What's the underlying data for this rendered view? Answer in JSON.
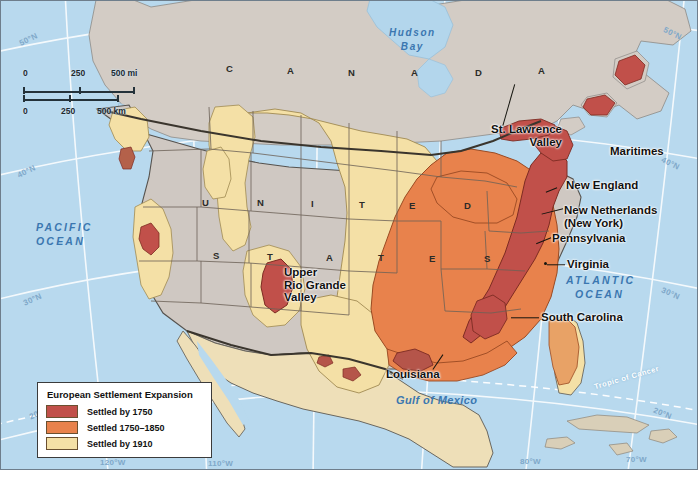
{
  "map": {
    "title": "European Settlement Expansion",
    "projection_note": "North America, conic projection",
    "background_water_color": "#b8d9ee",
    "land_unsettled_color": "#cfc8c2",
    "canada_land_color": "#d4cdc6"
  },
  "legend": {
    "title": "European Settlement Expansion",
    "items": [
      {
        "label": "Settled by 1750",
        "color": "#c1504a"
      },
      {
        "label": "Settled 1750–1850",
        "color": "#e8824c"
      },
      {
        "label": "Settled by 1910",
        "color": "#f4e0a6"
      }
    ]
  },
  "scale": {
    "miles": {
      "zero": "0",
      "mid": "250",
      "max": "500 mi"
    },
    "kilometers": {
      "zero": "0",
      "mid": "250",
      "max": "500 km"
    }
  },
  "country_labels": [
    {
      "text": "C A N A D A",
      "letters": [
        "C",
        "A",
        "N",
        "A",
        "D",
        "A"
      ]
    },
    {
      "text": "U N I T E D",
      "letters": [
        "U",
        "N",
        "I",
        "T",
        "E",
        "D"
      ]
    },
    {
      "text": "S T A T E S",
      "letters": [
        "S",
        "T",
        "A",
        "T",
        "E",
        "S"
      ]
    }
  ],
  "place_labels": [
    {
      "name": "st-lawrence-valley",
      "line1": "St. Lawrence",
      "line2": "Valley"
    },
    {
      "name": "maritimes",
      "line1": "Maritimes"
    },
    {
      "name": "new-england",
      "line1": "New England"
    },
    {
      "name": "new-netherlands",
      "line1": "New Netherlands",
      "line2": "(New York)"
    },
    {
      "name": "pennsylvania",
      "line1": "Pennsylvania"
    },
    {
      "name": "virginia",
      "line1": "Virginia"
    },
    {
      "name": "south-carolina",
      "line1": "South Carolina"
    },
    {
      "name": "louisiana",
      "line1": "Louisiana"
    },
    {
      "name": "upper-rio-grande",
      "line1": "Upper",
      "line2": "Rio Grande",
      "line3": "Valley"
    }
  ],
  "water_labels": [
    {
      "name": "pacific-ocean",
      "line1": "PACIFIC",
      "line2": "OCEAN"
    },
    {
      "name": "atlantic-ocean",
      "line1": "ATLANTIC",
      "line2": "OCEAN"
    },
    {
      "name": "hudson-bay",
      "line1": "Hudson",
      "line2": "Bay"
    },
    {
      "name": "gulf-of-mexico",
      "line1": "Gulf of Mexico"
    }
  ],
  "graticule": {
    "latitudes_left": [
      "50°N",
      "40°N",
      "30°N",
      "20°N"
    ],
    "latitudes_right": [
      "50°N",
      "40°N",
      "30°N",
      "20°N"
    ],
    "longitudes_bottom": [
      "120°W",
      "110°W",
      "80°W",
      "70°W"
    ],
    "tropic_label": "Tropic of Cancer"
  }
}
